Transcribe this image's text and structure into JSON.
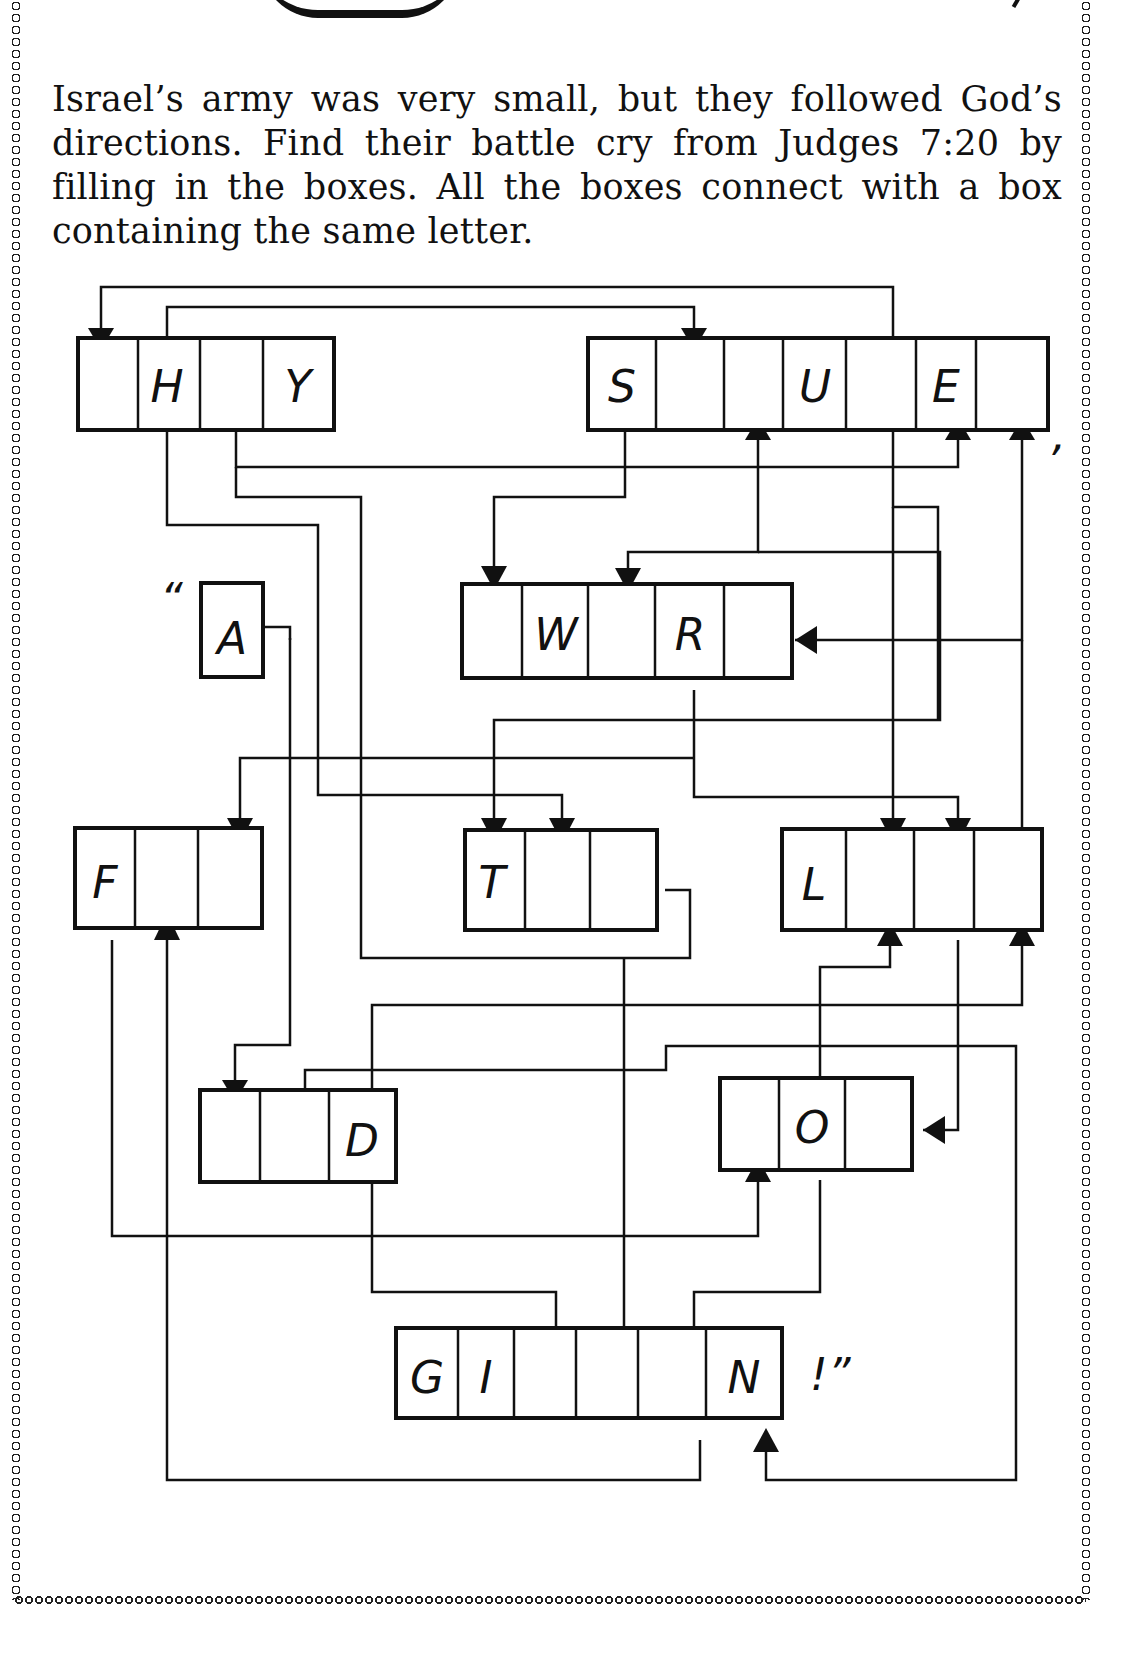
{
  "instructions": {
    "text": "Israel’s army was very small, but they followed God’s directions. Find their battle cry from Judges 7:20 by filling in the boxes. All the boxes connect with a box containing the same letter."
  },
  "puzzle": {
    "open_quote": "“",
    "comma": ",",
    "close_punct": "!”",
    "word_boxes": [
      {
        "id": "box-1",
        "cells": [
          "",
          "H",
          "",
          "Y"
        ]
      },
      {
        "id": "box-2",
        "cells": [
          "S",
          "",
          "",
          "U",
          "",
          "E",
          ""
        ]
      },
      {
        "id": "box-3",
        "cells": [
          "A"
        ]
      },
      {
        "id": "box-4",
        "cells": [
          "",
          "W",
          "",
          "R",
          ""
        ]
      },
      {
        "id": "box-5",
        "cells": [
          "F",
          "",
          ""
        ]
      },
      {
        "id": "box-6",
        "cells": [
          "T",
          "",
          ""
        ]
      },
      {
        "id": "box-7",
        "cells": [
          "L",
          "",
          "",
          ""
        ]
      },
      {
        "id": "box-8",
        "cells": [
          "",
          "",
          "D"
        ]
      },
      {
        "id": "box-9",
        "cells": [
          "",
          "O",
          ""
        ]
      },
      {
        "id": "box-10",
        "cells": [
          "G",
          "I",
          "",
          "",
          "",
          "N"
        ]
      }
    ]
  }
}
